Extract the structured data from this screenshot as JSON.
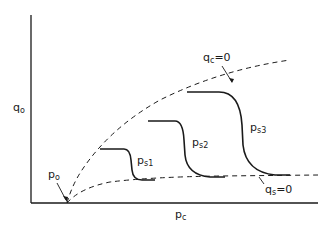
{
  "diagram": {
    "axes": {
      "y_label": "q",
      "y_label_sub": "o",
      "x_label": "p",
      "x_label_sub": "c"
    },
    "origin_label": {
      "main": "p",
      "sub": "o"
    },
    "boundary_curves": [
      {
        "id": "qc_zero",
        "label_main": "q",
        "label_sub": "c",
        "label_eq": "=0",
        "style": "dashed"
      },
      {
        "id": "qs_zero",
        "label_main": "q",
        "label_sub": "s",
        "label_eq": "=0",
        "style": "dashed"
      }
    ],
    "s_curves": [
      {
        "id": "ps1",
        "label_main": "p",
        "label_sub": "s1"
      },
      {
        "id": "ps2",
        "label_main": "p",
        "label_sub": "s2"
      },
      {
        "id": "ps3",
        "label_main": "p",
        "label_sub": "s3"
      }
    ],
    "colors": {
      "line": "#1a1a1a",
      "background": "#ffffff"
    }
  }
}
